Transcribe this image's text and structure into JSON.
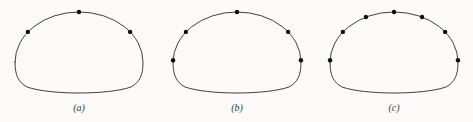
{
  "figure": {
    "background_color": "#fbfaf8",
    "curve_color": "#2a2a2a",
    "dot_color": "#0e0e0e",
    "label_color": "#3a3a3a",
    "panels": [
      {
        "label": "(a)",
        "dot_count": 3,
        "dot_angles_deg": [
          143,
          90,
          37
        ]
      },
      {
        "label": "(b)",
        "dot_count": 5,
        "dot_angles_deg": [
          178,
          143,
          90,
          37,
          2
        ]
      },
      {
        "label": "(c)",
        "dot_count": 7,
        "dot_angles_deg": [
          178,
          143,
          116,
          90,
          64,
          37,
          2
        ]
      }
    ]
  }
}
